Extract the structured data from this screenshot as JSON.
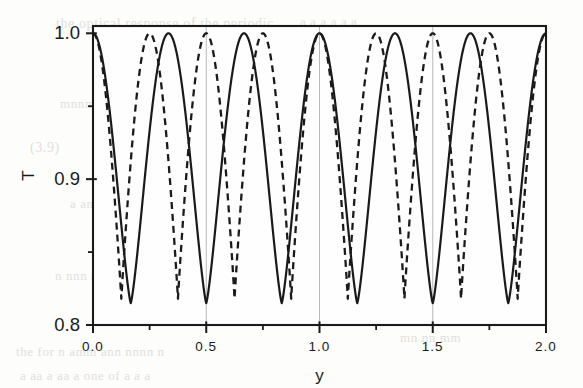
{
  "figure": {
    "background_color": "#fdfdfc",
    "ink_color": "#1a1a1a",
    "gridline_color": "#b9b9b9"
  },
  "ghost_text": {
    "lines": [
      {
        "text": "the optical response of the periodic",
        "x": 56,
        "y": 16,
        "size": 14
      },
      {
        "text": "a a a a a a",
        "x": 300,
        "y": 14,
        "size": 13
      },
      {
        "text": "transmission spectrum shown in",
        "x": 150,
        "y": 70,
        "size": 13
      },
      {
        "text": "mnnmn an nn  nnn",
        "x": 60,
        "y": 96,
        "size": 13
      },
      {
        "text": "(3.9)",
        "x": 30,
        "y": 140,
        "size": 14
      },
      {
        "text": "o o  m",
        "x": 330,
        "y": 150,
        "size": 13
      },
      {
        "text": "a  an  an am",
        "x": 70,
        "y": 196,
        "size": 13
      },
      {
        "text": "mmm  m  mmm",
        "x": 330,
        "y": 236,
        "size": 13
      },
      {
        "text": "n  nnn  an  anmn",
        "x": 55,
        "y": 268,
        "size": 13
      },
      {
        "text": "the  for  n  amm  ann  nnnn  n",
        "x": 16,
        "y": 344,
        "size": 13
      },
      {
        "text": "a   aa    a     aa  a   one of a    a  a",
        "x": 20,
        "y": 368,
        "size": 13
      },
      {
        "text": "mn  nn  mm",
        "x": 400,
        "y": 330,
        "size": 13
      }
    ]
  },
  "chart_data": {
    "type": "line",
    "title": "",
    "xlabel": "y",
    "ylabel": "T",
    "xlim": [
      0.0,
      2.0
    ],
    "ylim": [
      0.8,
      1.005
    ],
    "grid": "vertical-minor",
    "gridlines_x": [
      0.5,
      1.0,
      1.5
    ],
    "legend": "none",
    "x_ticks_major": [
      0.0,
      0.5,
      1.0,
      1.5,
      2.0
    ],
    "x_tick_labels": [
      "0.0",
      "0.5",
      "1.0",
      "1.5",
      "2.0"
    ],
    "x_ticks_minor": [
      0.25,
      0.75,
      1.25,
      1.75
    ],
    "y_ticks_major": [
      0.8,
      0.9,
      1.0
    ],
    "y_tick_labels": [
      "0.8",
      "0.9",
      "1.0"
    ],
    "y_ticks_minor": [
      0.85,
      0.95
    ],
    "series": [
      {
        "name": "solid",
        "style": "solid",
        "color": "#1a1a1a",
        "period": 0.3333333,
        "ymax": 1.0,
        "ymin": 0.815,
        "peaks_x": [
          0.0,
          0.3333,
          0.6667,
          1.0,
          1.3333,
          1.6667,
          2.0
        ],
        "troughs_x": [
          0.1667,
          0.5,
          0.8333,
          1.1667,
          1.5,
          1.8333
        ],
        "shape": "raised-cosine-sharp-trough",
        "sharpness": 1.55
      },
      {
        "name": "dashed",
        "style": "dashed",
        "color": "#1a1a1a",
        "period": 0.25,
        "ymax": 1.0,
        "ymin": 0.818,
        "peaks_x": [
          0.0,
          0.25,
          0.5,
          0.75,
          1.0,
          1.25,
          1.5,
          1.75,
          2.0
        ],
        "troughs_x": [
          0.125,
          0.375,
          0.625,
          0.875,
          1.125,
          1.375,
          1.625,
          1.875
        ],
        "shape": "raised-cosine-sharp-trough",
        "sharpness": 2.1
      }
    ]
  }
}
